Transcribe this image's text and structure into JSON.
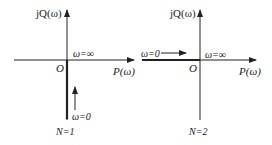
{
  "left": {
    "y_axis_label": "jQ(ω)",
    "x_axis_label": "P(ω)",
    "origin_label": "O",
    "omega_inf_label": "ω=∞",
    "omega_zero_label": "ω=0",
    "caption": "N=1"
  },
  "right": {
    "y_axis_label": "jQ(ω)",
    "x_axis_label": "P(ω)",
    "origin_label": "O",
    "omega_inf_label": "ω=∞",
    "omega_zero_label": "ω=0",
    "caption": "N=2"
  },
  "colors": {
    "line": "#222222",
    "background": "#ffffff"
  }
}
